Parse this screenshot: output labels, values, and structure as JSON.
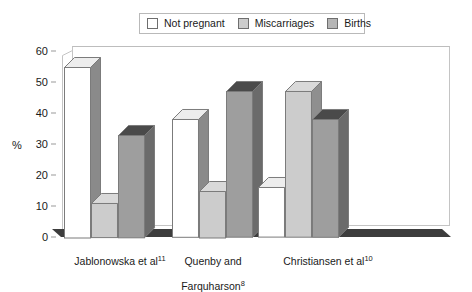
{
  "chart_data": {
    "type": "bar",
    "title": "",
    "subtitle": "",
    "xlabel": "",
    "ylabel": "%",
    "ylim": [
      0,
      60
    ],
    "ytick_step": 10,
    "yticks": [
      0,
      10,
      20,
      30,
      40,
      50,
      60
    ],
    "grid": false,
    "legend_position": "top-center",
    "style": "3d-grouped-bars",
    "categories": [
      "Jablonowska et al11",
      "Quenby and Farquharson8",
      "Christiansen et al10"
    ],
    "category_labels": [
      {
        "text": "Jablonowska et al",
        "superscript": "11",
        "line2": ""
      },
      {
        "text": "Quenby and",
        "line2": "Farquharson",
        "superscript": "8"
      },
      {
        "text": "Christiansen et al",
        "superscript": "10",
        "line2": ""
      }
    ],
    "series": [
      {
        "name": "Not pregnant",
        "color": "#ffffff",
        "values": [
          55,
          38,
          16
        ]
      },
      {
        "name": "Miscarriages",
        "color": "#cccccc",
        "values": [
          11,
          15,
          47
        ]
      },
      {
        "name": "Births",
        "color": "#9e9e9e",
        "values": [
          33,
          47,
          38
        ]
      }
    ],
    "annotations": []
  },
  "legend": {
    "items": [
      {
        "label": "Not pregnant",
        "color": "#ffffff"
      },
      {
        "label": "Miscarriages",
        "color": "#cccccc"
      },
      {
        "label": "Births",
        "color": "#9e9e9e"
      }
    ]
  },
  "axis": {
    "y_title": "%",
    "y_ticks": [
      "60",
      "50",
      "40",
      "30",
      "20",
      "10",
      "0"
    ]
  },
  "colors": {
    "face_not_pregnant": "#ffffff",
    "face_miscarriages": "#cccccc",
    "face_births": "#9e9e9e",
    "side_not_pregnant": "#8a8a8a",
    "side_miscarriages": "#8f8f8f",
    "side_births": "#6b6b6b",
    "top_not_pregnant": "#ededed",
    "top_miscarriages": "#d9d9d9",
    "top_births": "#4a4a4a",
    "outline": "#7b7b7b",
    "frame": "#c4c4c4",
    "floor": "#3d3d3d",
    "text": "#1a1a1a"
  }
}
